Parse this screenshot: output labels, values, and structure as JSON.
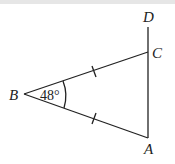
{
  "diagram": {
    "type": "geometry",
    "points": {
      "A": "A",
      "B": "B",
      "C": "C",
      "D": "D"
    },
    "angle_label": "48°",
    "segments": [
      "BC",
      "BA",
      "AD"
    ],
    "equal_marks": [
      "BC",
      "BA"
    ]
  }
}
